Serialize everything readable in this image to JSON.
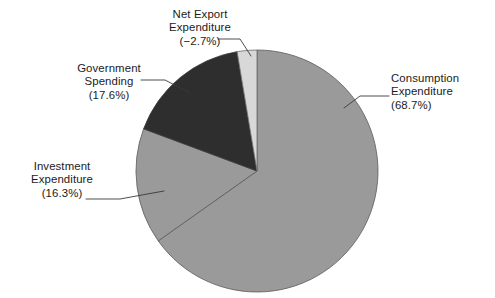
{
  "chart_data": {
    "type": "pie",
    "title": "",
    "subtitle": "",
    "xlabel": "",
    "ylabel": "",
    "legend_position": "none",
    "grid": false,
    "label_format": "name (percent%)",
    "categories": [
      "Consumption Expenditure",
      "Investment Expenditure",
      "Government Spending",
      "Net Export Expenditure"
    ],
    "values": [
      68.7,
      16.3,
      17.6,
      -2.7
    ],
    "value_unit": "percent",
    "slices": [
      {
        "name": "Consumption Expenditure",
        "value": 68.7,
        "percent_text": "(68.7%)",
        "color": "#9a9a9a",
        "label_lines": [
          "Consumption",
          "Expenditure",
          "(68.7%)"
        ]
      },
      {
        "name": "Investment Expenditure",
        "value": 16.3,
        "percent_text": "(16.3%)",
        "color": "#9a9a9a",
        "label_lines": [
          "Investment",
          "Expenditure",
          "(16.3%)"
        ]
      },
      {
        "name": "Government Spending",
        "value": 17.6,
        "percent_text": "(17.6%)",
        "color": "#2e2e2e",
        "label_lines": [
          "Government",
          "Spending",
          "(17.6%)"
        ]
      },
      {
        "name": "Net Export Expenditure",
        "value": -2.7,
        "percent_text": "(−2.7%)",
        "color": "#d8d8d8",
        "label_lines": [
          "Net Export",
          "Expenditure",
          "(−2.7%)"
        ]
      }
    ]
  },
  "colors": {
    "background": "#ffffff",
    "text": "#1b1b1b",
    "slice_medium_gray": "#9a9a9a",
    "slice_dark_gray": "#2e2e2e",
    "slice_light_gray": "#d8d8d8",
    "outline": "#4a4a4a",
    "leader_line": "#3a3a3a"
  },
  "labels": {
    "consumption": {
      "l1": "Consumption",
      "l2": "Expenditure",
      "l3": "(68.7%)"
    },
    "investment": {
      "l1": "Investment",
      "l2": "Expenditure",
      "l3": "(16.3%)"
    },
    "government": {
      "l1": "Government",
      "l2": "Spending",
      "l3": "(17.6%)"
    },
    "net_export": {
      "l1": "Net Export",
      "l2": "Expenditure",
      "l3": "(−2.7%)"
    }
  }
}
